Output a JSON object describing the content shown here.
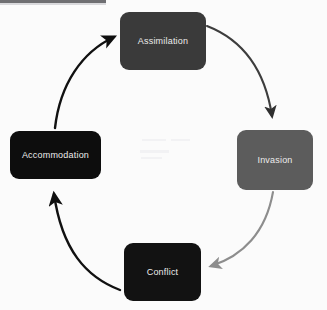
{
  "diagram": {
    "type": "cycle",
    "direction": "clockwise",
    "background_color": "#fbfbfb",
    "nodes": [
      {
        "id": "assimilation",
        "label": "Assimilation",
        "position": "top",
        "fill": "#3a3a3a",
        "text_color": "#ececec"
      },
      {
        "id": "invasion",
        "label": "Invasion",
        "position": "right",
        "fill": "#5c5c5c",
        "text_color": "#e8e8e8"
      },
      {
        "id": "conflict",
        "label": "Conflict",
        "position": "bottom",
        "fill": "#121212",
        "text_color": "#f0f0f0"
      },
      {
        "id": "accommodation",
        "label": "Accommodation",
        "position": "left",
        "fill": "#0d0d0d",
        "text_color": "#f0f0f0"
      }
    ],
    "arrows": [
      {
        "id": "assimilation-to-invasion",
        "from": "assimilation",
        "to": "invasion",
        "color": "#3d3d3d"
      },
      {
        "id": "invasion-to-conflict",
        "from": "invasion",
        "to": "conflict",
        "color": "#8d8d8d"
      },
      {
        "id": "conflict-to-accommodation",
        "from": "conflict",
        "to": "accommodation",
        "color": "#111111"
      },
      {
        "id": "accommodation-to-assimilation",
        "from": "accommodation",
        "to": "assimilation",
        "color": "#111111"
      }
    ]
  }
}
